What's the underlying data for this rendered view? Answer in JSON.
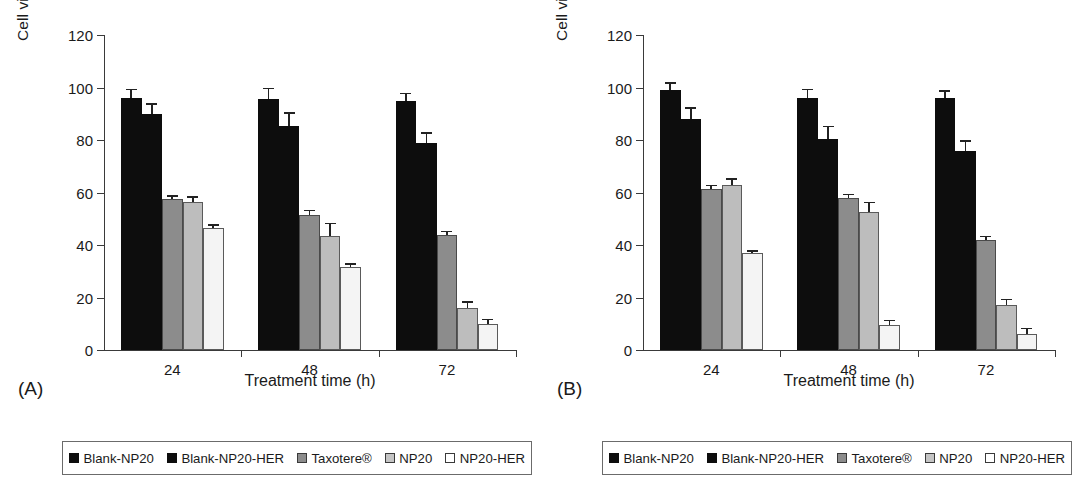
{
  "figure": {
    "panels": [
      {
        "tag": "(A)",
        "xlabel": "Treatment time (h)",
        "ylabel": "Cell viability (%)"
      },
      {
        "tag": "(B)",
        "xlabel": "Treatment time (h)",
        "ylabel": "Cell viability (%)"
      }
    ],
    "legend_items": [
      {
        "label": "Blank-NP20",
        "swatch": "filled-black-square-icon"
      },
      {
        "label": "Blank-NP20-HER",
        "swatch": "filled-black-square-icon"
      },
      {
        "label": "Taxotere®",
        "swatch": "filled-dark-gray-square-icon"
      },
      {
        "label": "NP20",
        "swatch": "filled-light-gray-square-icon"
      },
      {
        "label": "NP20-HER",
        "swatch": "open-white-square-icon"
      }
    ],
    "colors": {
      "series_0": "#0d0d0d",
      "series_1": "#0d0d0d",
      "series_2": "#8c8c8c",
      "series_3": "#bdbdbd",
      "series_4": "#f4f4f4",
      "axis": "#3a3a3a",
      "text": "#1a1a1a",
      "background": "#ffffff"
    }
  },
  "chart_data": [
    {
      "type": "bar",
      "title": "(A)",
      "xlabel": "Treatment time (h)",
      "ylabel": "Cell viability (%)",
      "categories": [
        "24",
        "48",
        "72"
      ],
      "ylim": [
        0,
        120
      ],
      "yticks": [
        0,
        20,
        40,
        60,
        80,
        100,
        120
      ],
      "grid": false,
      "legend_position": "bottom",
      "series": [
        {
          "name": "Blank-NP20",
          "values": [
            96.0,
            95.5,
            95.0
          ],
          "errors": [
            3.5,
            4.5,
            3.0
          ]
        },
        {
          "name": "Blank-NP20-HER",
          "values": [
            90.0,
            85.5,
            79.0
          ],
          "errors": [
            4.0,
            5.0,
            4.0
          ]
        },
        {
          "name": "Taxotere®",
          "values": [
            57.5,
            51.5,
            44.0
          ],
          "errors": [
            1.5,
            2.0,
            1.5
          ]
        },
        {
          "name": "NP20",
          "values": [
            56.5,
            43.5,
            16.0
          ],
          "errors": [
            2.0,
            5.0,
            2.5
          ]
        },
        {
          "name": "NP20-HER",
          "values": [
            46.5,
            31.5,
            10.0
          ],
          "errors": [
            1.5,
            1.5,
            2.0
          ]
        }
      ]
    },
    {
      "type": "bar",
      "title": "(B)",
      "xlabel": "Treatment time (h)",
      "ylabel": "Cell viability (%)",
      "categories": [
        "24",
        "48",
        "72"
      ],
      "ylim": [
        0,
        120
      ],
      "yticks": [
        0,
        20,
        40,
        60,
        80,
        100,
        120
      ],
      "grid": false,
      "legend_position": "bottom",
      "series": [
        {
          "name": "Blank-NP20",
          "values": [
            99.0,
            96.0,
            96.0
          ],
          "errors": [
            3.0,
            3.5,
            3.0
          ]
        },
        {
          "name": "Blank-NP20-HER",
          "values": [
            88.0,
            80.5,
            76.0
          ],
          "errors": [
            4.5,
            5.0,
            4.0
          ]
        },
        {
          "name": "Taxotere®",
          "values": [
            61.5,
            58.0,
            42.0
          ],
          "errors": [
            1.5,
            1.5,
            1.5
          ]
        },
        {
          "name": "NP20",
          "values": [
            63.0,
            52.5,
            17.0
          ],
          "errors": [
            2.5,
            4.0,
            2.5
          ]
        },
        {
          "name": "NP20-HER",
          "values": [
            37.0,
            9.5,
            6.0
          ],
          "errors": [
            1.0,
            2.0,
            2.5
          ]
        }
      ]
    }
  ]
}
